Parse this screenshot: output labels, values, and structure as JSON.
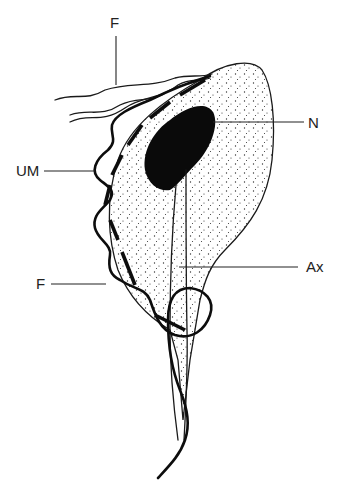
{
  "figure": {
    "labels": {
      "flagella_top": "F",
      "undulating_membrane": "UM",
      "nucleus": "N",
      "flagellum_lower": "F",
      "axostyle": "Ax"
    },
    "colors": {
      "background": "#ffffff",
      "ink": "#111111",
      "stipple": "#333333"
    }
  }
}
